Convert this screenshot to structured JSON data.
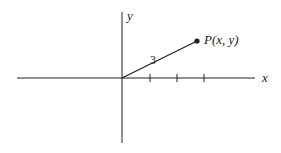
{
  "diagram": {
    "x_axis_label": "x",
    "y_axis_label": "y",
    "segment_label": "3",
    "point_label": "P(x, y)",
    "tick_count": 3,
    "colors": {
      "stroke": "#222222",
      "background": "#ffffff"
    }
  }
}
